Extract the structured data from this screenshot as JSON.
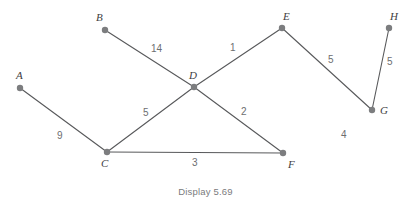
{
  "figure": {
    "caption": "Display 5.69",
    "colors": {
      "edge": "#58595b",
      "vertex": "#7c7d7f",
      "vertex_label": "#414042",
      "weight_label": "#6d6e70",
      "caption": "#7a7b7d",
      "background": "#ffffff"
    }
  },
  "graph": {
    "vertices": [
      {
        "id": "A",
        "label": "A",
        "x": 20,
        "y": 88,
        "label_x": 16,
        "label_y": 70
      },
      {
        "id": "B",
        "label": "B",
        "x": 105,
        "y": 30,
        "label_x": 96,
        "label_y": 12
      },
      {
        "id": "C",
        "label": "C",
        "x": 107,
        "y": 152,
        "label_x": 101,
        "label_y": 158
      },
      {
        "id": "D",
        "label": "D",
        "x": 194,
        "y": 87,
        "label_x": 189,
        "label_y": 70
      },
      {
        "id": "E",
        "label": "E",
        "x": 282,
        "y": 28,
        "label_x": 283,
        "label_y": 11
      },
      {
        "id": "F",
        "label": "F",
        "x": 283,
        "y": 153,
        "label_x": 288,
        "label_y": 159
      },
      {
        "id": "G",
        "label": "G",
        "x": 372,
        "y": 110,
        "label_x": 380,
        "label_y": 105
      },
      {
        "id": "H",
        "label": "H",
        "x": 389,
        "y": 28,
        "label_x": 390,
        "label_y": 11
      }
    ],
    "edges": [
      {
        "id": "A-C",
        "from": "A",
        "to": "C",
        "weight": "9",
        "label_x": 57,
        "label_y": 131
      },
      {
        "id": "B-D",
        "from": "B",
        "to": "D",
        "weight": "14",
        "label_x": 151,
        "label_y": 44
      },
      {
        "id": "C-D",
        "from": "C",
        "to": "D",
        "weight": "5",
        "label_x": 143,
        "label_y": 108
      },
      {
        "id": "C-F",
        "from": "C",
        "to": "F",
        "weight": "3",
        "label_x": 192,
        "label_y": 158
      },
      {
        "id": "D-E",
        "from": "D",
        "to": "E",
        "weight": "1",
        "label_x": 230,
        "label_y": 43
      },
      {
        "id": "D-F",
        "from": "D",
        "to": "F",
        "weight": "2",
        "label_x": 241,
        "label_y": 107
      },
      {
        "id": "E-G",
        "from": "E",
        "to": "G",
        "weight": "5",
        "label_x": 328,
        "label_y": 55
      },
      {
        "id": "G-H",
        "from": "G",
        "to": "H",
        "weight": "5",
        "label_x": 387,
        "label_y": 57
      }
    ],
    "floating_labels": [
      {
        "id": "four",
        "text": "4",
        "x": 341,
        "y": 130
      }
    ]
  }
}
